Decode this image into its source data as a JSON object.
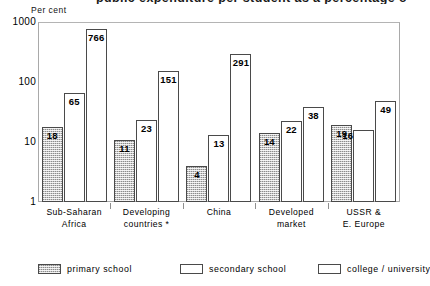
{
  "chart_data": {
    "type": "bar",
    "title": "public expenditure per student as a percentage of per capita GDP, 1980",
    "title_clipped": true,
    "subtitle": "",
    "xlabel": "",
    "ylabel": "Per cent",
    "yscale": "log",
    "ylim": [
      1,
      1000
    ],
    "yticks": [
      1,
      10,
      100,
      1000
    ],
    "ytick_labels": [
      "1",
      "10",
      "100",
      "1000"
    ],
    "grid": false,
    "legend_position": "bottom",
    "categories": [
      "Sub-Saharan\nAfrica",
      "Developing\ncountries *",
      "China",
      "Developed\nmarket",
      "USSR &\nE. Europe"
    ],
    "series": [
      {
        "name": "primary school",
        "fill": "hatch",
        "values": [
          18,
          11,
          4,
          14,
          19
        ]
      },
      {
        "name": "secondary school",
        "fill": "white",
        "values": [
          65,
          23,
          13,
          22,
          16
        ]
      },
      {
        "name": "college / university",
        "fill": "white",
        "values": [
          766,
          151,
          291,
          38,
          49
        ]
      }
    ]
  },
  "axis": {
    "unit_label": "Per cent",
    "ytick_labels": [
      "1000",
      "100",
      "10",
      "1"
    ]
  },
  "groups": [
    {
      "label_line1": "Sub-Saharan",
      "label_line2": "Africa",
      "bars": [
        {
          "series": "primary school",
          "value": "18",
          "label_outside": false
        },
        {
          "series": "secondary school",
          "value": "65",
          "label_outside": false
        },
        {
          "series": "college / university",
          "value": "766",
          "label_outside": false
        }
      ]
    },
    {
      "label_line1": "Developing",
      "label_line2": "countries *",
      "bars": [
        {
          "series": "primary school",
          "value": "11",
          "label_outside": false
        },
        {
          "series": "secondary school",
          "value": "23",
          "label_outside": false
        },
        {
          "series": "college / university",
          "value": "151",
          "label_outside": false
        }
      ]
    },
    {
      "label_line1": "China",
      "label_line2": "",
      "bars": [
        {
          "series": "primary school",
          "value": "4",
          "label_outside": false
        },
        {
          "series": "secondary school",
          "value": "13",
          "label_outside": false
        },
        {
          "series": "college / university",
          "value": "291",
          "label_outside": false
        }
      ]
    },
    {
      "label_line1": "Developed",
      "label_line2": "market",
      "bars": [
        {
          "series": "primary school",
          "value": "14",
          "label_outside": false
        },
        {
          "series": "secondary school",
          "value": "22",
          "label_outside": false
        },
        {
          "series": "college / university",
          "value": "38",
          "label_outside": false
        }
      ]
    },
    {
      "label_line1": "USSR &",
      "label_line2": "E. Europe",
      "bars": [
        {
          "series": "primary school",
          "value": "19",
          "label_outside": false
        },
        {
          "series": "secondary school",
          "value": "16",
          "label_outside": true
        },
        {
          "series": "college / university",
          "value": "49",
          "label_outside": false
        }
      ]
    }
  ],
  "legend": {
    "items": [
      {
        "label": "primary school",
        "fill": "hatch"
      },
      {
        "label": "secondary school",
        "fill": "white"
      },
      {
        "label": "college / university",
        "fill": "white"
      }
    ]
  },
  "colors": {
    "bar_outline": "#4a4a4a",
    "hatch_gray": "#c8c8c8",
    "frame": "#a9a9a9",
    "text": "#000000"
  }
}
